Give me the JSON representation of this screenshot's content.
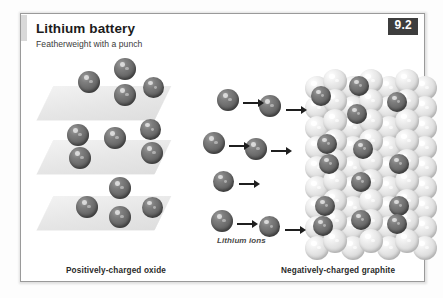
{
  "figure": {
    "title": "Lithium battery",
    "subtitle": "Featherweight with a punch",
    "badge": "9.2",
    "ion_label": "Lithium ions",
    "caption_left": "Positively-charged oxide",
    "caption_right": "Negatively-charged graphite"
  },
  "colors": {
    "page_background": "#fdfdfd",
    "card_background": "#ffffff",
    "card_border": "#9a9a9a",
    "badge_background": "#3d3d3d",
    "badge_text": "#ffffff",
    "title_text": "#1c1c1c",
    "subtitle_text": "#3a3a3a",
    "caption_text": "#2a2a2a",
    "ion_label_text": "#4a4a4a",
    "slab_fill": "#e9e9e9",
    "lithium_sphere": "#6a6a6a",
    "graphite_sphere": "#dcdcdc",
    "arrow": "#1f1f1f"
  },
  "diagram": {
    "slabs": [
      {
        "x": 24,
        "y": 72,
        "w": 118,
        "h": 34
      },
      {
        "x": 24,
        "y": 126,
        "w": 118,
        "h": 34
      },
      {
        "x": 24,
        "y": 182,
        "w": 118,
        "h": 34
      }
    ],
    "oxide_ions": [
      {
        "x": 93,
        "y": 44,
        "d": 22
      },
      {
        "x": 57,
        "y": 57,
        "d": 22
      },
      {
        "x": 93,
        "y": 70,
        "d": 22
      },
      {
        "x": 122,
        "y": 63,
        "d": 21
      },
      {
        "x": 46,
        "y": 110,
        "d": 22
      },
      {
        "x": 48,
        "y": 133,
        "d": 22
      },
      {
        "x": 83,
        "y": 113,
        "d": 22
      },
      {
        "x": 119,
        "y": 105,
        "d": 21
      },
      {
        "x": 120,
        "y": 128,
        "d": 22
      },
      {
        "x": 88,
        "y": 163,
        "d": 22
      },
      {
        "x": 55,
        "y": 182,
        "d": 22
      },
      {
        "x": 88,
        "y": 192,
        "d": 22
      },
      {
        "x": 121,
        "y": 183,
        "d": 21
      }
    ],
    "free_ions": [
      {
        "x": 196,
        "y": 75,
        "d": 22
      },
      {
        "x": 238,
        "y": 81,
        "d": 22
      },
      {
        "x": 182,
        "y": 118,
        "d": 22
      },
      {
        "x": 224,
        "y": 124,
        "d": 22
      },
      {
        "x": 192,
        "y": 157,
        "d": 21
      },
      {
        "x": 190,
        "y": 196,
        "d": 22
      },
      {
        "x": 238,
        "y": 202,
        "d": 21
      }
    ],
    "arrows": [
      {
        "x": 222,
        "y": 85,
        "len": 15
      },
      {
        "x": 265,
        "y": 92,
        "len": 15
      },
      {
        "x": 208,
        "y": 128,
        "len": 15
      },
      {
        "x": 250,
        "y": 133,
        "len": 15
      },
      {
        "x": 218,
        "y": 166,
        "len": 15
      },
      {
        "x": 216,
        "y": 206,
        "len": 15
      },
      {
        "x": 264,
        "y": 212,
        "len": 15
      }
    ],
    "graphite_columns": [
      {
        "x": 284,
        "y": 62,
        "count": 9,
        "step": 20
      },
      {
        "x": 302,
        "y": 55,
        "count": 9,
        "step": 20
      },
      {
        "x": 320,
        "y": 62,
        "count": 9,
        "step": 20
      },
      {
        "x": 338,
        "y": 55,
        "count": 9,
        "step": 20
      },
      {
        "x": 356,
        "y": 62,
        "count": 9,
        "step": 20
      },
      {
        "x": 374,
        "y": 55,
        "count": 9,
        "step": 20
      },
      {
        "x": 392,
        "y": 62,
        "count": 9,
        "step": 20
      }
    ],
    "graphite_ions": [
      {
        "x": 290,
        "y": 72,
        "d": 20
      },
      {
        "x": 328,
        "y": 62,
        "d": 20
      },
      {
        "x": 366,
        "y": 78,
        "d": 20
      },
      {
        "x": 326,
        "y": 90,
        "d": 20
      },
      {
        "x": 296,
        "y": 120,
        "d": 20
      },
      {
        "x": 298,
        "y": 140,
        "d": 20
      },
      {
        "x": 332,
        "y": 125,
        "d": 20
      },
      {
        "x": 368,
        "y": 140,
        "d": 20
      },
      {
        "x": 330,
        "y": 158,
        "d": 20
      },
      {
        "x": 294,
        "y": 182,
        "d": 20
      },
      {
        "x": 292,
        "y": 202,
        "d": 20
      },
      {
        "x": 330,
        "y": 196,
        "d": 20
      },
      {
        "x": 368,
        "y": 182,
        "d": 20
      },
      {
        "x": 366,
        "y": 200,
        "d": 20
      }
    ],
    "ion_label_pos": {
      "x": 196,
      "y": 222
    },
    "caption_left_pos": {
      "x": 45,
      "y": 252
    },
    "caption_right_pos": {
      "x": 260,
      "y": 252
    }
  }
}
